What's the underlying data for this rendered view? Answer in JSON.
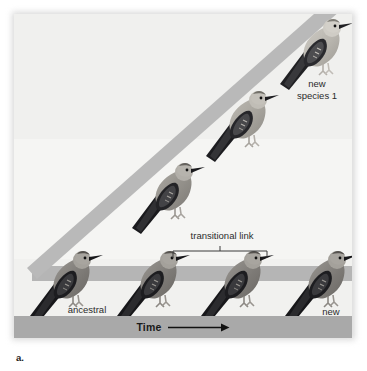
{
  "figure": {
    "caption": "a.",
    "panel_bg": "#f4f4f2",
    "band_color": "#b5b5b5",
    "time_bar_color": "#a9a9a9"
  },
  "axis": {
    "time_label": "Time",
    "arrow": "right-arrow"
  },
  "annotations": {
    "transitional_link": "transitional link",
    "ancestral_species": "ancestral\nspecies",
    "new_species_1": "new\nspecies 1",
    "new_species_2": "new\nspecies 2"
  },
  "birds": [
    {
      "name": "ancestral-species-bird",
      "lineage": "ancestral",
      "shade": "dark",
      "x": 26,
      "y": 238,
      "scale": 1.0
    },
    {
      "name": "lower-lineage-bird-2",
      "lineage": "lower",
      "shade": "dark",
      "x": 113,
      "y": 238,
      "scale": 1.0
    },
    {
      "name": "lower-lineage-bird-3",
      "lineage": "lower",
      "shade": "dark",
      "x": 197,
      "y": 238,
      "scale": 1.0
    },
    {
      "name": "new-species-2-bird",
      "lineage": "lower",
      "shade": "dark",
      "x": 281,
      "y": 238,
      "scale": 1.0
    },
    {
      "name": "diagonal-lineage-bird-1",
      "lineage": "diagonal",
      "shade": "mid",
      "x": 128,
      "y": 150,
      "scale": 1.0
    },
    {
      "name": "diagonal-lineage-bird-2",
      "lineage": "diagonal",
      "shade": "light",
      "x": 202,
      "y": 78,
      "scale": 1.0
    },
    {
      "name": "new-species-1-bird",
      "lineage": "diagonal",
      "shade": "lightest",
      "x": 276,
      "y": 6,
      "scale": 1.0
    }
  ]
}
